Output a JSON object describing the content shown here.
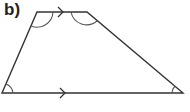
{
  "figure": {
    "label": "b)",
    "shape": "trapezium",
    "stroke_color": "#333333",
    "angle_arc_color": "#555555",
    "vertices": {
      "top_left": [
        37,
        12
      ],
      "top_right": [
        87,
        12
      ],
      "bottom_right": [
        183,
        93
      ],
      "bottom_left": [
        2,
        93
      ]
    },
    "parallel_marks": [
      {
        "side": "top",
        "count": 1,
        "icon": "arrow-right-icon"
      },
      {
        "side": "bottom",
        "count": 1,
        "icon": "arrow-right-icon"
      }
    ],
    "angle_marks": [
      "top_left",
      "top_right",
      "bottom_left",
      "bottom_right"
    ]
  }
}
